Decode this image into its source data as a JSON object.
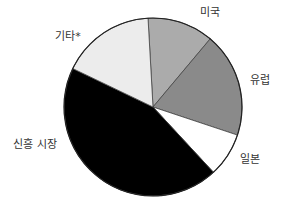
{
  "chart_data": {
    "type": "pie",
    "title": "",
    "categories": [
      "미국",
      "유럽",
      "일본",
      "신흥 시장",
      "기타*"
    ],
    "values": [
      12,
      19,
      8,
      44,
      17
    ],
    "unit": "%",
    "colors": [
      "#ababab",
      "#8a8a8a",
      "#ffffff",
      "#000000",
      "#ececec"
    ],
    "start_angle_deg": -93.2,
    "direction": "clockwise",
    "legend": "none (direct labels)",
    "labels": [
      {
        "text": "미국",
        "x": 210,
        "y": 16
      },
      {
        "text": "유럽",
        "x": 260,
        "y": 84
      },
      {
        "text": "일본",
        "x": 250,
        "y": 163
      },
      {
        "text": "신흥 시장",
        "x": 35,
        "y": 148
      },
      {
        "text": "기타*",
        "x": 68,
        "y": 40
      }
    ]
  },
  "geometry": {
    "cx": 153,
    "cy": 107,
    "r": 89,
    "stroke": "#222222"
  }
}
